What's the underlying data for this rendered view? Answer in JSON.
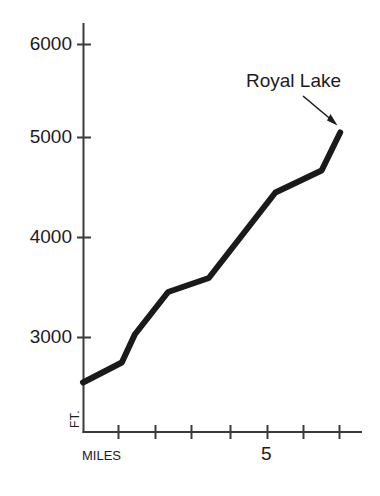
{
  "figure": {
    "background": "#ffffff",
    "line_color": "#1a1a1a",
    "axis_color": "#3a3a3a"
  },
  "axes": {
    "y_axis_title": "FT.",
    "x_axis_title": "MILES",
    "y_tick_labels": [
      "6000",
      "5000",
      "4000",
      "3000"
    ],
    "x_tick_labels": [
      "",
      "",
      "",
      "",
      "5",
      "",
      ""
    ]
  },
  "annotations": [
    {
      "name": "royal-lake-callout",
      "text": "Royal Lake"
    }
  ],
  "chart_data": {
    "type": "line",
    "title": "",
    "subtitle": "",
    "xlabel": "MILES",
    "ylabel": "FT.",
    "xlim": [
      0,
      7.6
    ],
    "ylim": [
      1900,
      6300
    ],
    "grid": false,
    "legend": "none",
    "x_ticks": [
      1,
      2,
      3,
      4,
      5,
      6,
      7
    ],
    "x_tick_labels": [
      "",
      "",
      "",
      "",
      "5",
      "",
      ""
    ],
    "y_ticks": [
      3000,
      4000,
      5000,
      6000
    ],
    "y_tick_labels": [
      "3000",
      "4000",
      "5000",
      "6000"
    ],
    "series": [
      {
        "name": "Elevation profile to Royal Lake",
        "x": [
          0.0,
          1.05,
          1.4,
          2.3,
          3.4,
          5.2,
          6.45,
          6.95
        ],
        "values": [
          2550,
          2750,
          3030,
          3455,
          3595,
          4450,
          4670,
          5050
        ]
      }
    ],
    "annotations": [
      {
        "text": "Royal Lake",
        "points_to_x": 6.95,
        "points_to_y": 5050
      }
    ]
  }
}
